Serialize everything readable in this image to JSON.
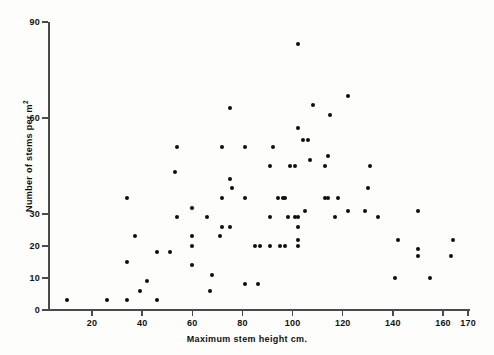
{
  "chart_data": {
    "type": "scatter",
    "title": "",
    "xlabel": "Maximum stem height cm.",
    "ylabel": "Number of stems per m",
    "ylabel_superscript": "2",
    "xlim": [
      0,
      172
    ],
    "ylim": [
      0,
      90
    ],
    "grid": false,
    "legend": null,
    "marker_color": "#0d0d0d",
    "axis_color": "#4a4a4a",
    "xticks": [
      20,
      40,
      60,
      80,
      100,
      120,
      140,
      160,
      170
    ],
    "xtick_labels": [
      "20",
      "40",
      "60",
      "80",
      "100",
      "120",
      "140",
      "160",
      "170"
    ],
    "yticks": [
      0,
      10,
      20,
      30,
      60,
      90
    ],
    "ytick_labels": [
      "0",
      "10",
      "20",
      "30",
      "60",
      "90"
    ],
    "points": [
      [
        10,
        3
      ],
      [
        26,
        3
      ],
      [
        34,
        3
      ],
      [
        34,
        15
      ],
      [
        34,
        35
      ],
      [
        37,
        23
      ],
      [
        39,
        6
      ],
      [
        42,
        9
      ],
      [
        46,
        3
      ],
      [
        46,
        18
      ],
      [
        51,
        18
      ],
      [
        53,
        43
      ],
      [
        54,
        29
      ],
      [
        54,
        51
      ],
      [
        60,
        14
      ],
      [
        60,
        20
      ],
      [
        60,
        23
      ],
      [
        60,
        32
      ],
      [
        66,
        29
      ],
      [
        67,
        6
      ],
      [
        68,
        11
      ],
      [
        71,
        23
      ],
      [
        72,
        26
      ],
      [
        72,
        35
      ],
      [
        72,
        51
      ],
      [
        75,
        26
      ],
      [
        75,
        41
      ],
      [
        75,
        63
      ],
      [
        76,
        38
      ],
      [
        81,
        8
      ],
      [
        81,
        35
      ],
      [
        81,
        51
      ],
      [
        85,
        20
      ],
      [
        86,
        8
      ],
      [
        87,
        20
      ],
      [
        91,
        20
      ],
      [
        91,
        29
      ],
      [
        91,
        45
      ],
      [
        92,
        51
      ],
      [
        94,
        35
      ],
      [
        95,
        20
      ],
      [
        96,
        35
      ],
      [
        97,
        20
      ],
      [
        97,
        35
      ],
      [
        98,
        29
      ],
      [
        99,
        45
      ],
      [
        101,
        29
      ],
      [
        101,
        45
      ],
      [
        102,
        20
      ],
      [
        102,
        22
      ],
      [
        102,
        26
      ],
      [
        102,
        29
      ],
      [
        102,
        57
      ],
      [
        102,
        83
      ],
      [
        104,
        53
      ],
      [
        105,
        31
      ],
      [
        106,
        53
      ],
      [
        107,
        47
      ],
      [
        108,
        64
      ],
      [
        113,
        35
      ],
      [
        113,
        45
      ],
      [
        114,
        35
      ],
      [
        114,
        48
      ],
      [
        115,
        61
      ],
      [
        117,
        29
      ],
      [
        118,
        35
      ],
      [
        122,
        31
      ],
      [
        122,
        67
      ],
      [
        129,
        31
      ],
      [
        130,
        38
      ],
      [
        131,
        45
      ],
      [
        134,
        29
      ],
      [
        141,
        10
      ],
      [
        142,
        22
      ],
      [
        150,
        17
      ],
      [
        150,
        19
      ],
      [
        150,
        31
      ],
      [
        155,
        10
      ],
      [
        163,
        17
      ],
      [
        164,
        22
      ]
    ]
  }
}
